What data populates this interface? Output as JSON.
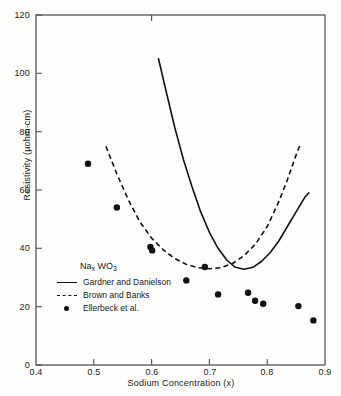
{
  "figure": {
    "background_color": "#fdfdfc",
    "axis_color": "#555555",
    "data_color": "#111111"
  },
  "axes": {
    "x_label": "Sodium Concentration (x)",
    "y_label": "Resistivity (µohm-cm)",
    "x_ticks": [
      "0.4",
      "0.5",
      "0.6",
      "0.7",
      "0.8",
      "0.9"
    ],
    "y_ticks": [
      "0",
      "20",
      "40",
      "60",
      "80",
      "100",
      "120"
    ]
  },
  "legend": {
    "title_main": "Na",
    "title_sub1": "x",
    "title_mid": " WO",
    "title_sub2": "3",
    "items": [
      {
        "key": "solid-line-key",
        "label": "Gardner and Danielson"
      },
      {
        "key": "dashed-line-key",
        "label": "Brown and Banks"
      },
      {
        "key": "dot-marker-key",
        "label": "Ellerbeck  et al."
      }
    ]
  },
  "chart_data": {
    "type": "scatter",
    "title": "",
    "xlabel": "Sodium Concentration (x)",
    "ylabel": "Resistivity (µohm-cm)",
    "xlim": [
      0.4,
      0.9
    ],
    "ylim": [
      0,
      120
    ],
    "xticks": [
      0.4,
      0.5,
      0.6,
      0.7,
      0.8,
      0.9
    ],
    "yticks": [
      0,
      20,
      40,
      60,
      80,
      100,
      120
    ],
    "grid": false,
    "legend_position": "lower-left-inside",
    "series": [
      {
        "name": "Gardner and Danielson",
        "style": "solid-line",
        "x": [
          0.612,
          0.625,
          0.64,
          0.655,
          0.67,
          0.685,
          0.7,
          0.715,
          0.73,
          0.745,
          0.76,
          0.775,
          0.79,
          0.805,
          0.82,
          0.835,
          0.85,
          0.865,
          0.872
        ],
        "y": [
          105.0,
          94.0,
          81.5,
          70.5,
          61.0,
          52.5,
          45.5,
          40.0,
          36.0,
          33.5,
          32.8,
          33.5,
          35.5,
          38.5,
          42.5,
          47.5,
          52.5,
          57.5,
          59.0
        ]
      },
      {
        "name": "Brown and Banks",
        "style": "dashed-line",
        "x": [
          0.521,
          0.54,
          0.56,
          0.58,
          0.6,
          0.62,
          0.64,
          0.66,
          0.68,
          0.7,
          0.72,
          0.74,
          0.76,
          0.78,
          0.8,
          0.82,
          0.835,
          0.85,
          0.857
        ],
        "y": [
          75.0,
          65.5,
          56.5,
          49.0,
          43.5,
          39.5,
          36.5,
          34.5,
          33.4,
          33.0,
          33.4,
          34.8,
          37.5,
          41.5,
          47.5,
          56.0,
          63.5,
          72.0,
          75.5
        ]
      },
      {
        "name": "Ellerbeck  et al.",
        "style": "markers",
        "x": [
          0.49,
          0.54,
          0.598,
          0.601,
          0.66,
          0.692,
          0.715,
          0.767,
          0.779,
          0.793,
          0.854,
          0.88
        ],
        "y": [
          69.0,
          54.0,
          40.5,
          39.3,
          29.0,
          33.6,
          24.2,
          24.8,
          22.0,
          21.0,
          20.2,
          15.3
        ]
      }
    ]
  }
}
